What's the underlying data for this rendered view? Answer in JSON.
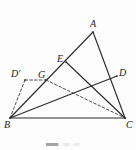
{
  "figure": {
    "type": "geometry-diagram",
    "caption": "",
    "canvas": {
      "width": 136,
      "height": 150
    },
    "stroke_color": "#2b2b2b",
    "dashed_color": "#3a3a3a",
    "background_color": "#fdfdfd",
    "points": [
      {
        "id": "A",
        "label": "A",
        "x": 93,
        "y": 32,
        "label_x": 90,
        "label_y": 19
      },
      {
        "id": "B",
        "label": "B",
        "x": 10,
        "y": 118,
        "label_x": 4,
        "label_y": 120
      },
      {
        "id": "C",
        "label": "C",
        "x": 125,
        "y": 118,
        "label_x": 126,
        "label_y": 120
      },
      {
        "id": "E",
        "label": "E",
        "x": 66,
        "y": 62,
        "label_x": 57,
        "label_y": 54
      },
      {
        "id": "D",
        "label": "D",
        "x": 117,
        "y": 76,
        "label_x": 119,
        "label_y": 68
      },
      {
        "id": "G",
        "label": "G",
        "x": 46,
        "y": 80,
        "label_x": 38,
        "label_y": 70
      },
      {
        "id": "Dp",
        "label": "D′",
        "x": 25,
        "y": 80,
        "label_x": 11,
        "label_y": 69
      }
    ],
    "solid_segments": [
      {
        "name": "segment-AB",
        "from": "A",
        "to": "B"
      },
      {
        "name": "segment-AC",
        "from": "A",
        "to": "C"
      },
      {
        "name": "segment-BC",
        "from": "B",
        "to": "C"
      },
      {
        "name": "segment-EC",
        "from": "E",
        "to": "C"
      },
      {
        "name": "segment-BD",
        "from": "B",
        "to": "D"
      }
    ],
    "dashed_segments": [
      {
        "name": "segment-Dprime-G",
        "from": "Dp",
        "to": "G"
      },
      {
        "name": "segment-Dprime-B",
        "from": "Dp",
        "to": "B"
      },
      {
        "name": "segment-G-C",
        "from": "G",
        "to": "C"
      }
    ]
  }
}
